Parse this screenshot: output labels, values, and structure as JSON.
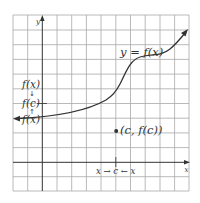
{
  "figure": {
    "type": "function graph with limit illustration",
    "curve_label": "y = f(x)",
    "point_label": "(c, f(c))",
    "x_axis_label": "x",
    "y_axis_label": "y",
    "y_labels": {
      "top": "f(x)",
      "middle": "f(c)",
      "bottom": "f(x)"
    },
    "x_approach_label": "x → c ← x",
    "colors": {
      "grid": "#9a9a9a",
      "axes": "#333333",
      "curve": "#333333",
      "text": "#333333",
      "background": "#ffffff"
    }
  }
}
